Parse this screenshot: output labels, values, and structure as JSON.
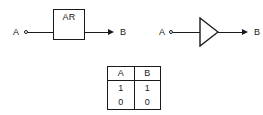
{
  "diagrams": [
    {
      "id": "block-diagram",
      "symbol": "rectangle-block",
      "input_label": "A",
      "block_label": "AR",
      "output_label": "B"
    },
    {
      "id": "buffer-diagram",
      "symbol": "buffer-triangle",
      "input_label": "A",
      "output_label": "B"
    }
  ],
  "truth_table": {
    "headers": [
      "A",
      "B"
    ],
    "rows": [
      [
        "1",
        "1"
      ],
      [
        "0",
        "0"
      ]
    ]
  },
  "colors": {
    "line": "#1a1a1a",
    "background": "#ffffff"
  }
}
